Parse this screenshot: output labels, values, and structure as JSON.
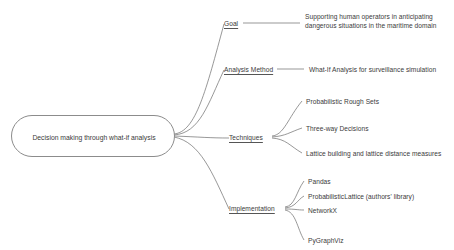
{
  "diagram": {
    "type": "mind-map",
    "background_color": "#ffffff",
    "stroke_color": "#6b6b6b",
    "text_color": "#3a3a3a",
    "root": {
      "label": "Decision making through what-if analysis"
    },
    "branches": [
      {
        "label": "Goal",
        "children": [
          {
            "label": "Supporting human operators in anticipating dangerous situations in the maritime domain"
          }
        ]
      },
      {
        "label": "Analysis Method",
        "children": [
          {
            "label": "What-If Analysis for surveillance simulation"
          }
        ]
      },
      {
        "label": "Techniques",
        "children": [
          {
            "label": "Probabilistic Rough Sets"
          },
          {
            "label": "Three-way Decisions"
          },
          {
            "label": "Lattice building and lattice distance measures"
          }
        ]
      },
      {
        "label": "Implementation",
        "children": [
          {
            "label": "Pandas"
          },
          {
            "label": "ProbabilisticLattice (authors' library)"
          },
          {
            "label": "NetworkX"
          },
          {
            "label": "PyGraphViz"
          }
        ]
      }
    ]
  }
}
